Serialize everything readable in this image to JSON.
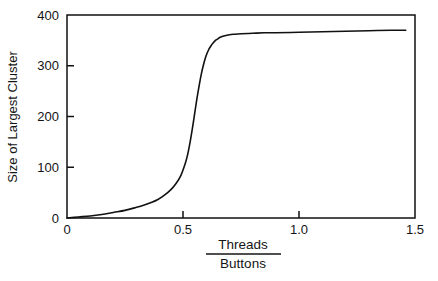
{
  "chart_data": {
    "type": "line",
    "title": "",
    "subtitle": "",
    "xlabel_numerator": "Threads",
    "xlabel_denominator": "Buttons",
    "xlabel": "Threads / Buttons",
    "ylabel": "Size of Largest Cluster",
    "xlim": [
      0,
      1.5
    ],
    "ylim": [
      0,
      400
    ],
    "xticks": [
      0,
      0.5,
      1.0,
      1.5
    ],
    "xtick_labels": [
      "0",
      "0.5",
      "1.0",
      "1.5"
    ],
    "yticks": [
      0,
      100,
      200,
      300,
      400
    ],
    "ytick_labels": [
      "0",
      "100",
      "200",
      "300",
      "400"
    ],
    "grid": false,
    "legend": null,
    "legend_position": "none",
    "annotations": [],
    "series": [
      {
        "name": "Size of Largest Cluster",
        "color": "#111111",
        "line_width": 1.6,
        "x": [
          0.0,
          0.05,
          0.1,
          0.15,
          0.2,
          0.25,
          0.3,
          0.33,
          0.36,
          0.39,
          0.42,
          0.45,
          0.47,
          0.49,
          0.51,
          0.52,
          0.53,
          0.54,
          0.55,
          0.56,
          0.57,
          0.58,
          0.59,
          0.6,
          0.61,
          0.62,
          0.63,
          0.64,
          0.65,
          0.66,
          0.68,
          0.7,
          0.72,
          0.75,
          0.8,
          0.85,
          0.9,
          1.0,
          1.1,
          1.2,
          1.3,
          1.4,
          1.46
        ],
        "y": [
          0,
          2,
          4,
          7,
          11,
          15,
          21,
          25,
          30,
          36,
          45,
          57,
          68,
          83,
          108,
          125,
          148,
          175,
          205,
          235,
          262,
          286,
          305,
          320,
          331,
          339,
          345,
          350,
          353,
          356,
          359,
          361,
          362,
          363,
          364,
          365,
          365,
          366,
          367,
          368,
          369,
          370,
          370
        ]
      }
    ]
  },
  "plot_geometry": {
    "left": 67,
    "right": 415,
    "top": 15,
    "bottom": 218,
    "frame_color": "#111111",
    "frame_width": 1.5,
    "tick_length": 7
  }
}
